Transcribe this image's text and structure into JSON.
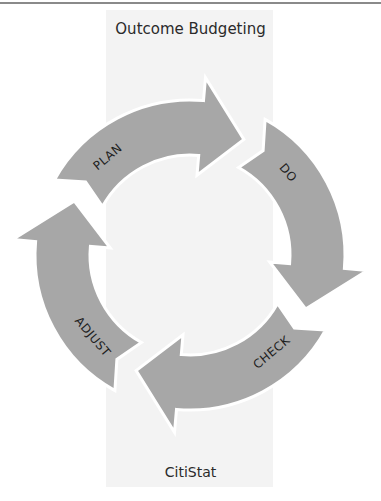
{
  "diagram": {
    "title": "Outcome Budgeting",
    "footer": "CitiStat",
    "cycle_type": "clockwise four-stage cycle",
    "stages": [
      {
        "label": "PLAN"
      },
      {
        "label": "DO"
      },
      {
        "label": "CHECK"
      },
      {
        "label": "ADJUST"
      }
    ],
    "colors": {
      "arrow_fill": "#a7a7a7",
      "arrow_gap": "#ffffff",
      "panel_background": "#f3f3f3",
      "text": "#1e1e1e"
    }
  }
}
